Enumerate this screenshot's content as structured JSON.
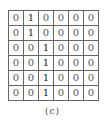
{
  "figure": {
    "caption": "(c)",
    "matrix": [
      [
        "0",
        "1",
        "0",
        "0",
        "0",
        "0"
      ],
      [
        "0",
        "1",
        "0",
        "0",
        "0",
        "0"
      ],
      [
        "0",
        "0",
        "1",
        "0",
        "0",
        "0"
      ],
      [
        "0",
        "0",
        "1",
        "0",
        "0",
        "0"
      ],
      [
        "0",
        "0",
        "1",
        "0",
        "0",
        "0"
      ],
      [
        "0",
        "0",
        "1",
        "0",
        "0",
        "0"
      ]
    ]
  }
}
